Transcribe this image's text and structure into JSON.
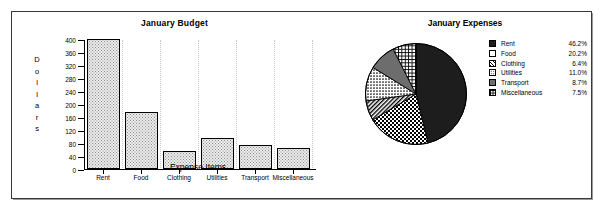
{
  "chart_data": [
    {
      "type": "bar",
      "title": "January Budget",
      "xlabel": "Expense Items",
      "ylabel": "Dollars",
      "ylabel_letters": [
        "D",
        "o",
        "l",
        "l",
        "a",
        "r",
        "s"
      ],
      "categories": [
        "Rent",
        "Food",
        "Clothing",
        "Utilities",
        "Transport",
        "Miscellaneous"
      ],
      "values": [
        400,
        175,
        55,
        95,
        75,
        65
      ],
      "yticks": [
        0,
        40,
        80,
        120,
        160,
        200,
        240,
        280,
        320,
        360,
        400
      ],
      "ylim": [
        0,
        400
      ],
      "grid": "dotted-vertical",
      "legend": "none"
    },
    {
      "type": "pie",
      "title": "January Expenses",
      "labels": [
        "Rent",
        "Food",
        "Clothing",
        "Utilities",
        "Transport",
        "Miscellaneous"
      ],
      "percents": [
        46.2,
        20.2,
        6.4,
        11.0,
        8.7,
        7.5
      ],
      "percent_labels": [
        "46.2%",
        "20.2%",
        "6.4%",
        "11.0%",
        "8.7%",
        "7.5%"
      ],
      "patterns": [
        "solid-black",
        "checkerboard",
        "diagonal-hatch",
        "fine-dot",
        "solid-gray",
        "grid-lines"
      ],
      "legend": "right"
    }
  ],
  "bar_chart": {
    "title": "January Budget",
    "xlabel": "Expense Items",
    "ylabel_letters": [
      "D",
      "o",
      "l",
      "l",
      "a",
      "r",
      "s"
    ],
    "yticks": [
      "0",
      "40",
      "80",
      "120",
      "160",
      "200",
      "240",
      "280",
      "320",
      "360",
      "400"
    ],
    "bars": [
      {
        "label": "Rent",
        "value": 400
      },
      {
        "label": "Food",
        "value": 175
      },
      {
        "label": "Clothing",
        "value": 55
      },
      {
        "label": "Utilities",
        "value": 95
      },
      {
        "label": "Transport",
        "value": 75
      },
      {
        "label": "Miscellaneous",
        "value": 65
      }
    ]
  },
  "pie_chart": {
    "title": "January Expenses",
    "legend": [
      {
        "label": "Rent",
        "percent": "46.2%"
      },
      {
        "label": "Food",
        "percent": "20.2%"
      },
      {
        "label": "Clothing",
        "percent": "6.4%"
      },
      {
        "label": "Utilities",
        "percent": "11.0%"
      },
      {
        "label": "Transport",
        "percent": "8.7%"
      },
      {
        "label": "Miscellaneous",
        "percent": "7.5%"
      }
    ]
  },
  "colors": {
    "frame_border": "#3a3a3a",
    "axis": "#000000",
    "grid": "#c9c9c9",
    "bar_fill": "#ededed",
    "pie_dark": "#1d1d1d",
    "pie_gray": "#6d6d6d",
    "background": "#ffffff"
  }
}
